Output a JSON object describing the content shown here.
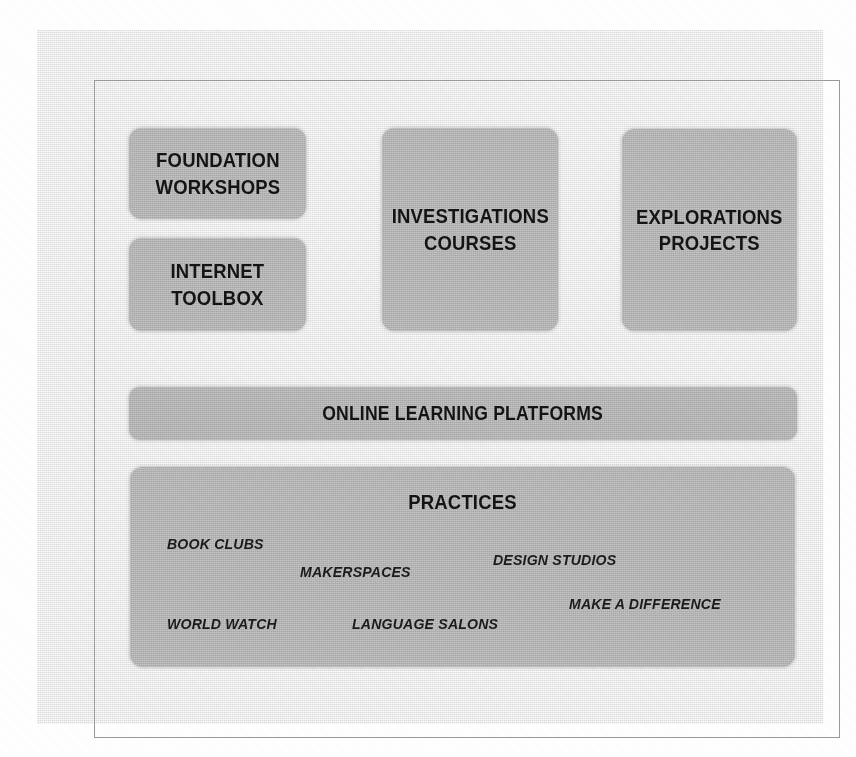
{
  "diagram": {
    "background_color": "#ebebeb",
    "block_color": "#b9b9b9",
    "text_color": "#141414",
    "top_row": [
      {
        "id": "foundation-workshops",
        "label": "FOUNDATION\nWORKSHOPS"
      },
      {
        "id": "internet-toolbox",
        "label": "INTERNET\nTOOLBOX"
      },
      {
        "id": "investigations-courses",
        "label": "INVESTIGATIONS\nCOURSES"
      },
      {
        "id": "explorations-projects",
        "label": "EXPLORATIONS\nPROJECTS"
      }
    ],
    "platforms_bar": {
      "id": "online-learning-platforms",
      "label": "ONLINE LEARNING PLATFORMS"
    },
    "practices": {
      "id": "practices",
      "title": "PRACTICES",
      "items": [
        {
          "id": "book-clubs",
          "label": "BOOK CLUBS"
        },
        {
          "id": "makerspaces",
          "label": "MAKERSPACES"
        },
        {
          "id": "design-studios",
          "label": "DESIGN STUDIOS"
        },
        {
          "id": "make-a-difference",
          "label": "MAKE A DIFFERENCE"
        },
        {
          "id": "world-watch",
          "label": "WORLD WATCH"
        },
        {
          "id": "language-salons",
          "label": "LANGUAGE SALONS"
        }
      ]
    }
  }
}
